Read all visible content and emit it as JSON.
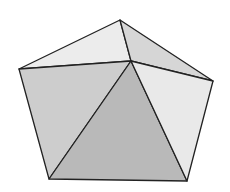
{
  "figure": {
    "type": "polyhedron-diagram",
    "width": 230,
    "height": 192,
    "background": "#ffffff",
    "stroke": "#222222",
    "stroke_width": 1.3,
    "vertices": {
      "top": [
        120,
        20
      ],
      "left": [
        19,
        69
      ],
      "right": [
        213,
        81
      ],
      "bottom_left": [
        49,
        179
      ],
      "bottom_right": [
        187,
        181
      ],
      "inner": [
        131,
        61
      ]
    },
    "faces": [
      {
        "name": "top-left-face",
        "points": "120,20 19,69 131,61",
        "fill": "#ececec"
      },
      {
        "name": "top-right-face",
        "points": "120,20 131,61 213,81",
        "fill": "#d6d6d6"
      },
      {
        "name": "left-face",
        "points": "19,69 131,61 49,179",
        "fill": "#cdcdcd"
      },
      {
        "name": "center-face",
        "points": "131,61 49,179 187,181",
        "fill": "#b9b9b9"
      },
      {
        "name": "right-face",
        "points": "131,61 213,81 187,181",
        "fill": "#e9e9e9"
      }
    ]
  }
}
